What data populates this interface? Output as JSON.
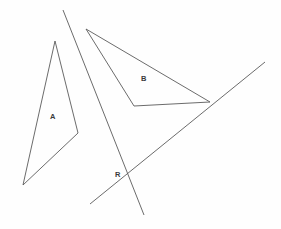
{
  "figure": {
    "background_color": "#fefefe",
    "stroke_color": "#5a5a5a",
    "label_color": "#3b3b3b",
    "width": 281,
    "height": 229
  },
  "labels": {
    "triangle_a": "A",
    "triangle_b": "B",
    "intersection_r": "R"
  },
  "chart_data": {
    "type": "diagram",
    "shapes": [
      {
        "name": "triangle-a",
        "label": "A",
        "label_position": [
          53,
          117
        ],
        "kind": "triangle",
        "points": [
          [
            55,
            41
          ],
          [
            78,
            133
          ],
          [
            23,
            185
          ]
        ]
      },
      {
        "name": "triangle-b",
        "label": "B",
        "label_position": [
          144,
          79
        ],
        "kind": "triangle",
        "points": [
          [
            86,
            29
          ],
          [
            210,
            102
          ],
          [
            134,
            106
          ]
        ]
      }
    ],
    "lines": [
      {
        "name": "steep-line",
        "from": [
          63,
          10
        ],
        "to": [
          144,
          215
        ]
      },
      {
        "name": "diagonal-line",
        "from": [
          90,
          204
        ],
        "to": [
          265,
          62
        ]
      }
    ],
    "points": [
      {
        "name": "intersection-r",
        "label": "R",
        "position": [
          128,
          180
        ],
        "label_position": [
          118,
          175
        ]
      }
    ]
  }
}
